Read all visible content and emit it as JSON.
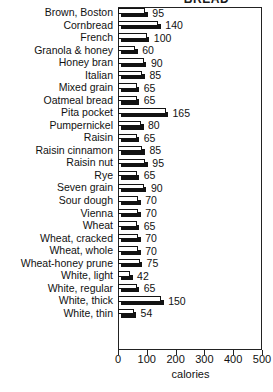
{
  "chart_data": {
    "type": "bar",
    "orientation": "horizontal",
    "title": "BREAD",
    "xlabel": "calories",
    "ylabel": "",
    "xlim": [
      0,
      500
    ],
    "xticks": [
      0,
      100,
      200,
      300,
      400,
      500
    ],
    "xticklabels": [
      "0",
      "100",
      "200",
      "300",
      "400",
      "500"
    ],
    "grid": false,
    "legend": "none",
    "categories": [
      "Brown, Boston",
      "Cornbread",
      "French",
      "Granola & honey",
      "Honey bran",
      "Italian",
      "Mixed grain",
      "Oatmeal bread",
      "Pita pocket",
      "Pumpernickel",
      "Raisin",
      "Raisin cinnamon",
      "Raisin nut",
      "Rye",
      "Seven grain",
      "Sour dough",
      "Vienna",
      "Wheat",
      "Wheat, cracked",
      "Wheat, whole",
      "Wheat-honey prune",
      "White, light",
      "White, regular",
      "White, thick",
      "White, thin"
    ],
    "values": [
      95,
      140,
      100,
      60,
      90,
      85,
      65,
      65,
      165,
      80,
      65,
      85,
      95,
      65,
      90,
      70,
      70,
      65,
      70,
      70,
      75,
      42,
      65,
      150,
      54
    ],
    "value_labels": [
      "95",
      "140",
      "100",
      "60",
      "90",
      "85",
      "65",
      "65",
      "165",
      "80",
      "65",
      "85",
      "95",
      "65",
      "90",
      "70",
      "70",
      "65",
      "70",
      "70",
      "75",
      "42",
      "65",
      "150",
      "54"
    ],
    "bar_face_color": "#ffffff",
    "bar_edge_color": "#121212",
    "bar_shadow_color": "#121212",
    "axis_color": "#222222",
    "text_color": "#111111"
  }
}
